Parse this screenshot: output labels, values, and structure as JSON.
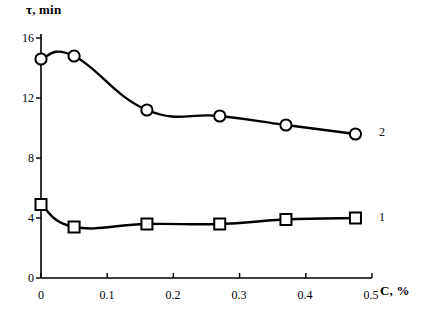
{
  "chart_data": {
    "type": "line",
    "title": "",
    "xlabel": "C, %",
    "ylabel": "τ, min",
    "xlim": [
      0,
      0.5
    ],
    "ylim": [
      0,
      16
    ],
    "grid": false,
    "legend_position": "right-of-plot",
    "xticks": [
      "0",
      "0.1",
      "0.2",
      "0.3",
      "0.4",
      "0.5"
    ],
    "xtick_values": [
      0,
      0.1,
      0.2,
      0.3,
      0.4,
      0.5
    ],
    "yticks": [
      "0",
      "4",
      "8",
      "12",
      "16"
    ],
    "ytick_values": [
      0,
      4,
      8,
      12,
      16
    ],
    "x": [
      0,
      0.05,
      0.16,
      0.27,
      0.37,
      0.475
    ],
    "series": [
      {
        "name": "1",
        "marker": "square",
        "values": [
          4.9,
          3.4,
          3.6,
          3.6,
          3.9,
          4.0
        ]
      },
      {
        "name": "2",
        "marker": "circle",
        "values": [
          14.6,
          14.8,
          11.2,
          10.8,
          10.2,
          9.6
        ]
      }
    ],
    "colors": {
      "line": "#000000",
      "marker_fill": "#ffffff",
      "axis": "#000000",
      "background": "#ffffff"
    }
  },
  "caption": {
    "clipped_text": ""
  }
}
